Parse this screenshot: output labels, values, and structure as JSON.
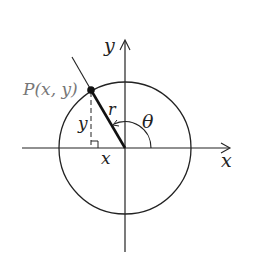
{
  "diagram": {
    "type": "unit-circle-polar",
    "labels": {
      "y_axis": "y",
      "x_axis": "x",
      "point": "P(x, y)",
      "radius": "r",
      "angle": "θ",
      "leg_y": "y",
      "leg_x": "x"
    },
    "colors": {
      "stroke": "#222222",
      "point_label": "#777777",
      "background": "#ffffff"
    }
  }
}
